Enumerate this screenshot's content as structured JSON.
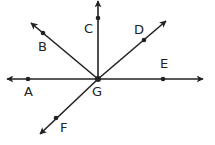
{
  "diagram": {
    "type": "rays-from-point",
    "center_label": "G",
    "points": [
      {
        "label": "A"
      },
      {
        "label": "B"
      },
      {
        "label": "C"
      },
      {
        "label": "D"
      },
      {
        "label": "E"
      },
      {
        "label": "F"
      }
    ],
    "rays": [
      "GA",
      "GB",
      "GC",
      "GD",
      "GE",
      "GF"
    ],
    "color": "#222222"
  }
}
